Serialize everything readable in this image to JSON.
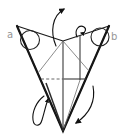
{
  "labels": {
    "point_a": "a",
    "point_b": "b"
  },
  "colors": {
    "background": "#ffffff",
    "paper_fill": "#c6c6c6",
    "outline": "#1b1b1b",
    "crease": "#6e6e6e",
    "label_text": "#979797",
    "arrow": "#111111"
  },
  "elements": {
    "shape": "folded-paper-model",
    "markers": [
      "circle-highlight-a",
      "circle-highlight-b"
    ],
    "arrows": [
      "pull-open-arrow",
      "fold-over-loop-arrow",
      "swing-down-arrow",
      "wrap-behind-arrow"
    ],
    "fold_line": "dashed-valley-fold"
  }
}
